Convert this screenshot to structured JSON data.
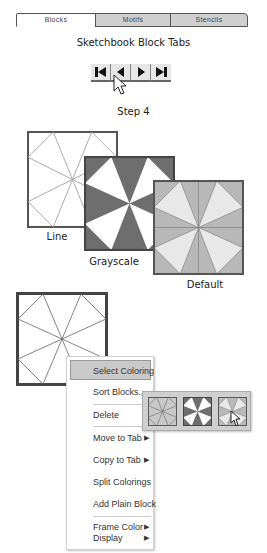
{
  "tabs": {
    "items": [
      {
        "label": "Blocks",
        "state": "active"
      },
      {
        "label": "Motifs",
        "state": "inactive"
      },
      {
        "label": "Stencils",
        "state": "inactive"
      }
    ],
    "caption": "Sketchbook Block Tabs"
  },
  "navigation": {
    "buttons": [
      {
        "icon": "first-icon",
        "label": "First"
      },
      {
        "icon": "previous-icon",
        "label": "Previous"
      },
      {
        "icon": "next-icon",
        "label": "Next"
      },
      {
        "icon": "last-icon",
        "label": "Last"
      }
    ],
    "caption": "Step 4"
  },
  "colorings": [
    {
      "label": "Line",
      "style": "line"
    },
    {
      "label": "Grayscale",
      "style": "grayscale"
    },
    {
      "label": "Default",
      "style": "default"
    }
  ],
  "colors": {
    "grayscale_dark": "#6e6e6e",
    "default_dark": "#b4b4b4",
    "default_light": "#e8e8e8",
    "line_stroke": "#888888",
    "frame": "#555555",
    "menu_highlight": "#c9c9c9"
  },
  "context_menu": {
    "items": [
      {
        "label": "Select Coloring",
        "selected": true,
        "submenu": false
      },
      {
        "label": "Sort Blocks...",
        "submenu": false
      },
      {
        "label": "Delete",
        "submenu": false
      },
      {
        "label": "Move to Tab",
        "submenu": true
      },
      {
        "label": "Copy to Tab",
        "submenu": true
      },
      {
        "label": "Split Colorings",
        "submenu": false
      },
      {
        "label": "Add Plain Block",
        "submenu": false
      },
      {
        "label": "Frame Color",
        "submenu": true
      },
      {
        "label": "Display",
        "submenu": true
      }
    ],
    "submenu_arrow": "▶"
  },
  "coloring_submenu": {
    "options": [
      "line",
      "grayscale",
      "default"
    ],
    "hovered": "default"
  }
}
